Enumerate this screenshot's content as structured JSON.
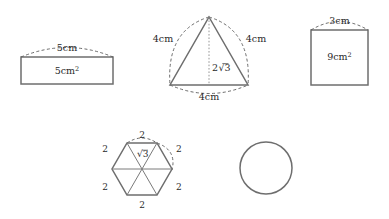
{
  "figure": {
    "stroke_color": "#6e6e6e",
    "dash_color": "#5a5a5a",
    "text_color": "#2a2a2a",
    "background": "#ffffff",
    "width": 389,
    "height": 219
  },
  "shapes": {
    "rectangle": {
      "name": "rectangle-5cm",
      "arc_label": "5cm",
      "area_label": "5cm",
      "area_exponent": "2"
    },
    "triangle": {
      "name": "equilateral-triangle-4cm",
      "left_label": "4cm",
      "right_label": "4cm",
      "base_label": "4cm",
      "height_label_prefix": "2",
      "height_label_radicand": "3"
    },
    "square": {
      "name": "square-3cm",
      "arc_label": "3cm",
      "area_label": "9cm",
      "area_exponent": "2"
    },
    "hexagon": {
      "name": "hexagon-side-2",
      "top_label": "2",
      "upper_left_label": "2",
      "upper_right_label": "2",
      "lower_left_label": "2",
      "lower_right_label": "2",
      "bottom_label": "2",
      "apothem_radicand": "3"
    },
    "circle": {
      "name": "plain-circle"
    }
  }
}
